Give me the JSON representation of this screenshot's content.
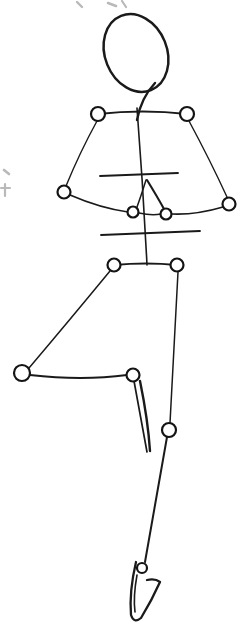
{
  "canvas": {
    "width": 249,
    "height": 631,
    "background_color": "#ffffff",
    "ink_color": "#1a1a1a",
    "faint_color": "#b9b9b9",
    "joint_fill_color": "#ffffff",
    "medium": "pencil-and-ink-line-drawing",
    "subject": "human figure armature mannequin"
  },
  "artwork": {
    "title": "Figure Armature Gesture Sketch",
    "description": "Hand drawn stick-and-joint mannequin of a standing human figure seen from the front-left, with open circles marking shoulders, elbows, hands, hips, knees and ankle.",
    "orientation": "portrait",
    "stroke_style": "freehand"
  },
  "figure": {
    "head": {
      "label": "head-oval",
      "center_x": 136,
      "center_y": 53,
      "radius_x": 31,
      "radius_y": 40,
      "rotation_deg": -22,
      "shape": "egg"
    },
    "neck": {
      "label": "neck-line",
      "from_x": 155,
      "from_y": 83,
      "to_x": 137,
      "to_y": 120
    },
    "spine": {
      "label": "spine-line",
      "from_x": 137,
      "from_y": 108,
      "to_x": 147,
      "to_y": 265
    },
    "chest_line": {
      "label": "chest-guide-line",
      "from_x": 100,
      "from_y": 176,
      "to_x": 178,
      "to_y": 173
    },
    "waist_line": {
      "label": "waist-guide-line",
      "from_x": 101,
      "from_y": 235,
      "to_x": 200,
      "to_y": 231
    }
  },
  "joints": [
    {
      "name": "shoulder-left",
      "cx": 98,
      "cy": 114,
      "r": 7.0
    },
    {
      "name": "shoulder-right",
      "cx": 187,
      "cy": 114,
      "r": 7.0
    },
    {
      "name": "elbow-left",
      "cx": 64,
      "cy": 192,
      "r": 6.5
    },
    {
      "name": "elbow-right",
      "cx": 229,
      "cy": 204,
      "r": 6.5
    },
    {
      "name": "hand-left",
      "cx": 133,
      "cy": 212,
      "r": 5.5
    },
    {
      "name": "hand-right",
      "cx": 166,
      "cy": 214,
      "r": 5.5
    },
    {
      "name": "hip-left",
      "cx": 114,
      "cy": 265,
      "r": 6.5
    },
    {
      "name": "hip-right",
      "cx": 177,
      "cy": 265,
      "r": 6.5
    },
    {
      "name": "foot-left",
      "cx": 22,
      "cy": 373,
      "r": 8.0
    },
    {
      "name": "knee-left",
      "cx": 133,
      "cy": 375,
      "r": 6.5
    },
    {
      "name": "knee-right",
      "cx": 169,
      "cy": 430,
      "r": 7.0
    },
    {
      "name": "ankle-right",
      "cx": 142,
      "cy": 568,
      "r": 5.0
    }
  ],
  "limbs": [
    {
      "name": "shoulder-span",
      "path": "M 98 114 Q 143 109 187 114",
      "width": 1.9
    },
    {
      "name": "upper-arm-left",
      "path": "M 97 121 Q 80 152 66 186",
      "width": 1.4
    },
    {
      "name": "upper-arm-right",
      "path": "M 189 121 Q 210 160 227 197",
      "width": 1.4
    },
    {
      "name": "forearm-left",
      "path": "M 70 195 Q 100 208 128 212",
      "width": 1.6
    },
    {
      "name": "forearm-right",
      "path": "M 223 207 Q 196 215 172 214",
      "width": 1.6
    },
    {
      "name": "hand-gap-span",
      "path": "M 139 213 Q 152 216 161 214",
      "width": 1.6
    },
    {
      "name": "ribcage-wedge-left",
      "path": "M 146 180 Q 141 196 137 207",
      "width": 1.5
    },
    {
      "name": "ribcage-wedge-right",
      "path": "M 147 180 Q 158 198 164 209",
      "width": 2.1
    },
    {
      "name": "hip-span",
      "path": "M 114 265 Q 146 262 177 265",
      "width": 2.2
    },
    {
      "name": "thigh-left",
      "path": "M 110 271 Q 68 322 29 368",
      "width": 1.5
    },
    {
      "name": "shin-left",
      "path": "M 30 375 Q 82 381 127 375",
      "width": 2.0
    },
    {
      "name": "thigh-right",
      "path": "M 178 272 Q 174 352 170 423",
      "width": 1.5
    },
    {
      "name": "knee-wedge-left",
      "path": "M 134 381 Q 142 425 147 452",
      "width": 1.7
    },
    {
      "name": "knee-wedge-right",
      "path": "M 140 381 Q 148 420 150 451",
      "width": 2.4
    },
    {
      "name": "shin-right",
      "path": "M 167 437 Q 156 500 145 562",
      "width": 2.0
    },
    {
      "name": "foot-right-outline",
      "path": "M 136 562 Q 129 592 131 615 Q 134 624 141 618 Q 152 600 160 582 Q 155 578 147 580",
      "width": 2.3
    },
    {
      "name": "foot-right-inner",
      "path": "M 137 575 Q 133 597 135 612",
      "width": 1.6
    }
  ],
  "faint_marks": [
    {
      "name": "top-margin-mark-1",
      "path": "M 77 2 L 82 7",
      "width": 2.4
    },
    {
      "name": "top-margin-mark-2",
      "path": "M 108 3 L 116 6",
      "width": 2.6
    },
    {
      "name": "top-margin-mark-3",
      "path": "M 122 1 L 126 7",
      "width": 2.2
    },
    {
      "name": "left-margin-mark-1",
      "path": "M 4 170 L 9 174",
      "width": 2.6
    },
    {
      "name": "left-margin-mark-2",
      "path": "M 5 184 L 5 196",
      "width": 2.2
    },
    {
      "name": "left-margin-mark-3",
      "path": "M 1 188 L 10 188",
      "width": 2.0
    }
  ]
}
